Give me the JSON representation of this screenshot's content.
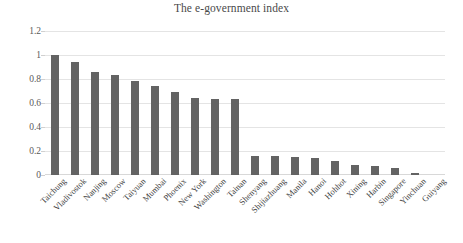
{
  "chart_data": {
    "type": "bar",
    "title": "The e-government index",
    "xlabel": "",
    "ylabel": "",
    "ylim": [
      0,
      1.2
    ],
    "yticks": [
      "0",
      "0.2",
      "0.4",
      "0.6",
      "0.8",
      "1",
      "1.2"
    ],
    "ytick_values": [
      0,
      0.2,
      0.4,
      0.6,
      0.8,
      1,
      1.2
    ],
    "grid": "horizontal",
    "legend": "none",
    "bar_color": "#636363",
    "gridline_color": "#e4e4e4",
    "categories": [
      "Taichung",
      "Vladivostok",
      "Nanjing",
      "Moscow",
      "Taiyuan",
      "Mumbai",
      "Phoenix",
      "New York",
      "Washington",
      "Tainan",
      "Shenyang",
      "Shijiazhuang",
      "Manila",
      "Hanoi",
      "Hohhot",
      "Xining",
      "Harbin",
      "Singapore",
      "Yinchuan",
      "Guiyang"
    ],
    "values": [
      1.0,
      0.94,
      0.86,
      0.83,
      0.78,
      0.74,
      0.69,
      0.64,
      0.635,
      0.63,
      0.16,
      0.155,
      0.15,
      0.145,
      0.12,
      0.08,
      0.075,
      0.06,
      0.02,
      0
    ]
  }
}
